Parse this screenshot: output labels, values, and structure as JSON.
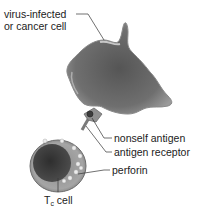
{
  "diagram": {
    "labels": {
      "target_line1": "virus-infected",
      "target_line2": "or cancer cell",
      "nonself_antigen": "nonself antigen",
      "antigen_receptor": "antigen receptor",
      "perforin": "perforin",
      "tc_cell_main": "T",
      "tc_cell_sub": "c",
      "tc_cell_suffix": " cell"
    },
    "colors": {
      "target_cell": "#6e6e6e",
      "target_cell_dark": "#4a4a4a",
      "tc_cell_outer": "#9a9a9a",
      "tc_nucleus": "#3a3a3a",
      "granules": "#e8e8e8",
      "leader_line": "#333333"
    }
  }
}
